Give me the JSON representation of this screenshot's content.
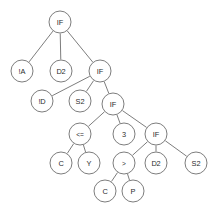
{
  "diagram": {
    "type": "tree",
    "background_color": "#ffffff",
    "node_fill": "#ffffff",
    "node_stroke": "#6e6e6e",
    "edge_color": "#6e6e6e",
    "text_color": "#2b2b2b",
    "node_radius": 11,
    "nodes": [
      {
        "id": "n0",
        "label": "IF",
        "x": 60,
        "y": 22,
        "r": 11,
        "style": "word"
      },
      {
        "id": "n1",
        "label": "!A",
        "x": 22,
        "y": 71,
        "r": 11,
        "style": "word"
      },
      {
        "id": "n2",
        "label": "D2",
        "x": 61,
        "y": 71,
        "r": 11,
        "style": "word"
      },
      {
        "id": "n3",
        "label": "IF",
        "x": 100,
        "y": 71,
        "r": 11,
        "style": "word"
      },
      {
        "id": "n4",
        "label": "!D",
        "x": 42,
        "y": 101,
        "r": 11,
        "style": "word"
      },
      {
        "id": "n5",
        "label": "S2",
        "x": 80,
        "y": 101,
        "r": 11,
        "style": "word"
      },
      {
        "id": "n6",
        "label": "IF",
        "x": 113,
        "y": 104,
        "r": 11,
        "style": "word"
      },
      {
        "id": "n7",
        "label": "<=",
        "x": 80,
        "y": 134,
        "r": 11,
        "style": "op"
      },
      {
        "id": "n8",
        "label": "3",
        "x": 124,
        "y": 134,
        "r": 11,
        "style": "word"
      },
      {
        "id": "n9",
        "label": "IF",
        "x": 156,
        "y": 134,
        "r": 11,
        "style": "word"
      },
      {
        "id": "n10",
        "label": "C",
        "x": 61,
        "y": 163,
        "r": 11,
        "style": "word"
      },
      {
        "id": "n11",
        "label": "Y",
        "x": 89,
        "y": 163,
        "r": 11,
        "style": "word"
      },
      {
        "id": "n12",
        "label": ">",
        "x": 124,
        "y": 163,
        "r": 11,
        "style": "op"
      },
      {
        "id": "n13",
        "label": "D2",
        "x": 156,
        "y": 163,
        "r": 11,
        "style": "word"
      },
      {
        "id": "n14",
        "label": "S2",
        "x": 196,
        "y": 163,
        "r": 11,
        "style": "word"
      },
      {
        "id": "n15",
        "label": "C",
        "x": 105,
        "y": 191,
        "r": 11,
        "style": "word"
      },
      {
        "id": "n16",
        "label": "P",
        "x": 133,
        "y": 191,
        "r": 11,
        "style": "word"
      }
    ],
    "edges": [
      {
        "from": "n0",
        "to": "n1"
      },
      {
        "from": "n0",
        "to": "n2"
      },
      {
        "from": "n0",
        "to": "n3"
      },
      {
        "from": "n3",
        "to": "n4"
      },
      {
        "from": "n3",
        "to": "n5"
      },
      {
        "from": "n3",
        "to": "n6"
      },
      {
        "from": "n6",
        "to": "n7"
      },
      {
        "from": "n6",
        "to": "n8"
      },
      {
        "from": "n6",
        "to": "n9"
      },
      {
        "from": "n7",
        "to": "n10"
      },
      {
        "from": "n7",
        "to": "n11"
      },
      {
        "from": "n9",
        "to": "n12"
      },
      {
        "from": "n9",
        "to": "n13"
      },
      {
        "from": "n9",
        "to": "n14"
      },
      {
        "from": "n12",
        "to": "n15"
      },
      {
        "from": "n12",
        "to": "n16"
      }
    ]
  }
}
